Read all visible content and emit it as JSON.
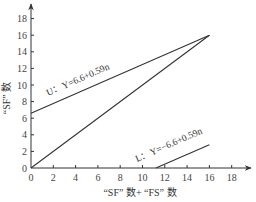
{
  "chart_data": {
    "type": "line",
    "title": "",
    "xlabel": "“SF” 数+ “FS” 数",
    "ylabel": "“SF” 数",
    "xlim": [
      0,
      19
    ],
    "ylim": [
      0,
      19
    ],
    "xticks": [
      0,
      2,
      4,
      6,
      8,
      10,
      12,
      14,
      16,
      18
    ],
    "yticks": [
      0,
      2,
      4,
      6,
      8,
      10,
      12,
      14,
      16,
      18
    ],
    "grid": false,
    "legend": "none",
    "series": [
      {
        "name": "U",
        "label": "U：Y=6.6+0.59n",
        "x": [
          0,
          16
        ],
        "y": [
          6.6,
          16
        ]
      },
      {
        "name": "diagonal",
        "label": "",
        "x": [
          0,
          16
        ],
        "y": [
          0,
          16
        ]
      },
      {
        "name": "L",
        "label": "L：Y=−6.6+0.59n",
        "x": [
          11.2,
          16
        ],
        "y": [
          0,
          2.8
        ]
      }
    ],
    "annotations": [
      {
        "text": "U：Y=6.6+0.59n",
        "near": "upper line"
      },
      {
        "text": "L：Y=−6.6+0.59n",
        "near": "lower line"
      }
    ]
  },
  "layout": {
    "origin_px": [
      31,
      168
    ],
    "x_px_per_unit": 11.15,
    "y_px_per_unit": 8.3
  },
  "colors": {
    "line": "#333333",
    "axis": "#333333",
    "text": "#444444"
  }
}
